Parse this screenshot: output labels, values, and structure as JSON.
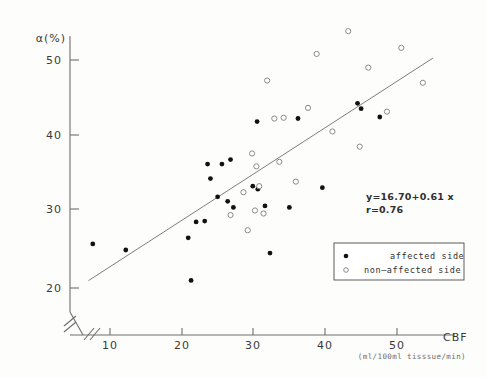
{
  "chart_data": {
    "type": "scatter",
    "title": "",
    "xlabel": "CBF",
    "xlabel_units": "(ml/100ml tisssue/min)",
    "ylabel": "α(%)",
    "xlim": [
      6,
      56
    ],
    "ylim": [
      18,
      54
    ],
    "x_ticks": [
      10,
      20,
      30,
      40,
      50
    ],
    "y_ticks": [
      20,
      30,
      40,
      50
    ],
    "x_axis_break": true,
    "grid": false,
    "legend_position": "lower-right",
    "annotations": [
      "y=16.70+0.61 x",
      "r=0.76"
    ],
    "fit": {
      "label": "y=16.70+0.61 x",
      "intercept": 16.7,
      "slope": 0.61,
      "r": 0.76,
      "x_start": 7.0,
      "x_end": 55.0
    },
    "series": [
      {
        "name": "affected side",
        "marker": "filled-circle",
        "color": "#111111",
        "points": [
          [
            7.6,
            25.8
          ],
          [
            12.2,
            25.0
          ],
          [
            20.9,
            26.6
          ],
          [
            21.3,
            21.0
          ],
          [
            22.0,
            28.7
          ],
          [
            23.2,
            28.8
          ],
          [
            23.6,
            36.3
          ],
          [
            24.0,
            34.4
          ],
          [
            25.6,
            36.3
          ],
          [
            26.8,
            36.9
          ],
          [
            25.0,
            32.0
          ],
          [
            26.4,
            31.4
          ],
          [
            27.2,
            30.6
          ],
          [
            29.9,
            33.4
          ],
          [
            30.5,
            41.9
          ],
          [
            30.6,
            33.0
          ],
          [
            31.6,
            30.8
          ],
          [
            32.3,
            24.6
          ],
          [
            35.0,
            30.6
          ],
          [
            36.2,
            42.3
          ],
          [
            39.6,
            33.2
          ],
          [
            44.5,
            44.3
          ],
          [
            45.0,
            43.6
          ],
          [
            47.6,
            42.5
          ]
        ]
      },
      {
        "name": "non—affected side",
        "marker": "open-circle",
        "color": "#ffffff",
        "points": [
          [
            26.8,
            29.6
          ],
          [
            28.6,
            32.6
          ],
          [
            29.2,
            27.6
          ],
          [
            29.8,
            37.7
          ],
          [
            30.2,
            30.2
          ],
          [
            30.4,
            36.0
          ],
          [
            30.8,
            33.4
          ],
          [
            31.4,
            29.8
          ],
          [
            31.9,
            47.3
          ],
          [
            32.9,
            42.3
          ],
          [
            33.6,
            36.6
          ],
          [
            34.2,
            42.4
          ],
          [
            35.9,
            34.0
          ],
          [
            37.6,
            43.7
          ],
          [
            38.8,
            50.8
          ],
          [
            41.0,
            40.6
          ],
          [
            43.2,
            53.8
          ],
          [
            44.8,
            38.6
          ],
          [
            46.0,
            49.0
          ],
          [
            48.6,
            43.2
          ],
          [
            50.6,
            51.6
          ],
          [
            53.6,
            47.0
          ]
        ]
      }
    ]
  },
  "axes": {
    "y_label": "α(%)",
    "y_tick_labels": [
      "50",
      "40",
      "30",
      "20"
    ],
    "x_tick_labels": [
      "10",
      "20",
      "30",
      "40",
      "50"
    ],
    "x_label": "CBF",
    "x_units": "(ml/100ml tisssue/min)"
  },
  "equation_block": {
    "line1": "y=16.70+0.61 x",
    "line2": "r=0.76"
  },
  "legend": {
    "items": [
      {
        "marker": "filled-circle",
        "label": "affected side"
      },
      {
        "marker": "open-circle",
        "label": "non—affected side"
      }
    ]
  }
}
